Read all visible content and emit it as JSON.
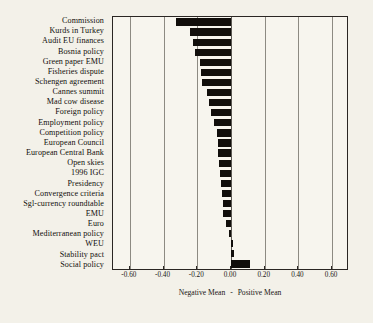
{
  "chart_data": {
    "type": "bar",
    "orientation": "horizontal",
    "title": "",
    "subtitle": "",
    "xlabel_left": "Negative Mean",
    "xlabel_sep": "-",
    "xlabel_right": "Positive Mean",
    "xlabel": "Negative Mean  -  Positive Mean",
    "ylabel": "",
    "xlim": [
      -0.7,
      0.7
    ],
    "xticks": [
      -0.6,
      -0.4,
      -0.2,
      0.0,
      0.2,
      0.4,
      0.6
    ],
    "xtick_labels": [
      "-0.60",
      "-0.40",
      "-0.20",
      "0.00",
      "0.20",
      "0.40",
      "0.60"
    ],
    "grid": true,
    "grid_axis": "x",
    "legend": false,
    "bar_color": "#110e0b",
    "background_color": "#f7f5ee",
    "categories": [
      "Commission",
      "Kurds in Turkey",
      "Audit EU finances",
      "Bosnia policy",
      "Green paper EMU",
      "Fisheries dispute",
      "Schengen agreement",
      "Cannes summit",
      "Mad cow disease",
      "Foreign policy",
      "Employment policy",
      "Competition policy",
      "European Council",
      "European Central Bank",
      "Open skies",
      "1996 IGC",
      "Presidency",
      "Convergence criteria",
      "Sgl-currency roundtable",
      "EMU",
      "Euro",
      "Mediterranean policy",
      "WEU",
      "Stability pact",
      "Social policy"
    ],
    "values": [
      -0.325,
      -0.245,
      -0.225,
      -0.215,
      -0.185,
      -0.18,
      -0.175,
      -0.14,
      -0.13,
      -0.12,
      -0.1,
      -0.085,
      -0.075,
      -0.075,
      -0.07,
      -0.065,
      -0.06,
      -0.055,
      -0.05,
      -0.045,
      -0.028,
      -0.01,
      0.012,
      0.02,
      0.11
    ]
  }
}
